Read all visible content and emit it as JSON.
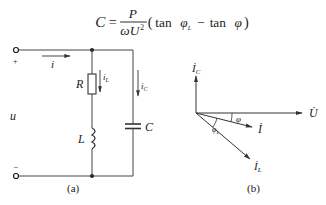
{
  "formula": {
    "lhs": "C",
    "equals": "=",
    "numerator": "P",
    "denominator_omega": "ω",
    "denominator_U": "U",
    "denominator_exp": "2",
    "open_paren": "(",
    "tan1": "tan",
    "phi_L": "φ",
    "phi_L_sub": "L",
    "minus": "−",
    "tan2": "tan",
    "phi": "φ",
    "close_paren": ")"
  },
  "circuit": {
    "caption": "(a)",
    "plus_label": "+",
    "minus_label": "−",
    "voltage_label": "u",
    "current_label": "i",
    "resistor_label": "R",
    "inductor_label": "L",
    "capacitor_label": "C",
    "iL_main": "i",
    "iL_sub": "L",
    "iC_main": "i",
    "iC_sub": "C"
  },
  "phasor": {
    "caption": "(b)",
    "U_label": "U̇",
    "I_label": "İ",
    "IL_main": "İ",
    "IL_sub": "L",
    "IC_main": "İ",
    "IC_sub": "C",
    "phi_label": "φ",
    "phiL_main": "φ",
    "phiL_sub": "L"
  }
}
